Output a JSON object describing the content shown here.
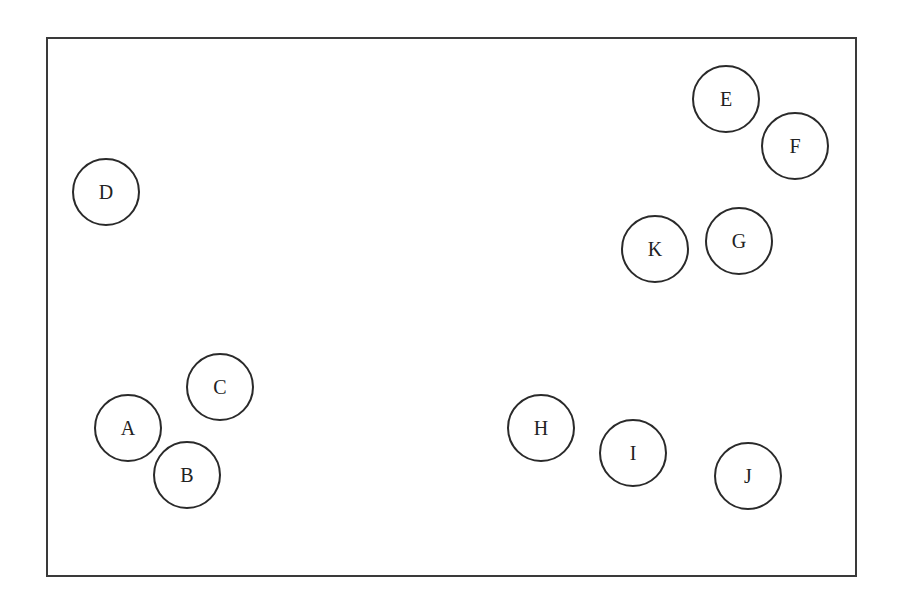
{
  "diagram": {
    "type": "labeled circles in frame",
    "nodes": [
      {
        "label": "A",
        "cx": 128,
        "cy": 428
      },
      {
        "label": "B",
        "cx": 187,
        "cy": 475
      },
      {
        "label": "C",
        "cx": 220,
        "cy": 387
      },
      {
        "label": "D",
        "cx": 106,
        "cy": 192
      },
      {
        "label": "E",
        "cx": 726,
        "cy": 99
      },
      {
        "label": "F",
        "cx": 795,
        "cy": 146
      },
      {
        "label": "G",
        "cx": 739,
        "cy": 241
      },
      {
        "label": "H",
        "cx": 541,
        "cy": 428
      },
      {
        "label": "I",
        "cx": 633,
        "cy": 453
      },
      {
        "label": "J",
        "cx": 748,
        "cy": 476
      },
      {
        "label": "K",
        "cx": 655,
        "cy": 249
      }
    ]
  }
}
